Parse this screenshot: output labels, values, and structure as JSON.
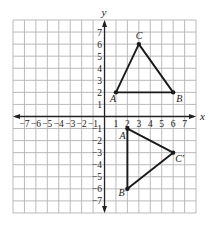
{
  "diagram": {
    "type": "coordinate-plane",
    "grid": {
      "x_min": -8,
      "x_max": 8,
      "y_min": -8,
      "y_max": 8,
      "pixel_left": 13,
      "pixel_top": 20,
      "cell_w": 11.44,
      "cell_h": 12.06,
      "grid_color": "#b3b3b3",
      "axis_color": "#222222"
    },
    "axes": {
      "x_label": "x",
      "y_label": "y",
      "x_ticks": [
        "−7",
        "−6",
        "−5",
        "−4",
        "−3",
        "−2",
        "−1",
        "1",
        "2",
        "3",
        "4",
        "5",
        "6",
        "7"
      ],
      "x_tick_values": [
        -7,
        -6,
        -5,
        -4,
        -3,
        -2,
        -1,
        1,
        2,
        3,
        4,
        5,
        6,
        7
      ],
      "y_ticks": [
        "7",
        "6",
        "5",
        "4",
        "3",
        "2",
        "1",
        "−1",
        "−2",
        "−3",
        "−4",
        "−5",
        "−6",
        "−7"
      ],
      "y_tick_values": [
        7,
        6,
        5,
        4,
        3,
        2,
        1,
        -1,
        -2,
        -3,
        -4,
        -5,
        -6,
        -7
      ]
    },
    "shapes": [
      {
        "name": "triangle-ABC",
        "stroke": "#1a1a1a",
        "vertices": [
          {
            "label": "A",
            "x": 1,
            "y": 2,
            "label_dx": -6,
            "label_dy": 10
          },
          {
            "label": "B",
            "x": 6,
            "y": 2,
            "label_dx": 3,
            "label_dy": 10
          },
          {
            "label": "C",
            "x": 3,
            "y": 6,
            "label_dx": -3,
            "label_dy": -5
          }
        ]
      },
      {
        "name": "triangle-A-prime-B-prime-C-prime",
        "stroke": "#1a1a1a",
        "vertices": [
          {
            "label": "A′",
            "x": 2,
            "y": -1,
            "label_dx": -8,
            "label_dy": 10
          },
          {
            "label": "C′",
            "x": 6,
            "y": -3,
            "label_dx": 2,
            "label_dy": 9
          },
          {
            "label": "B′",
            "x": 2,
            "y": -6,
            "label_dx": -9,
            "label_dy": 7
          }
        ]
      }
    ]
  }
}
